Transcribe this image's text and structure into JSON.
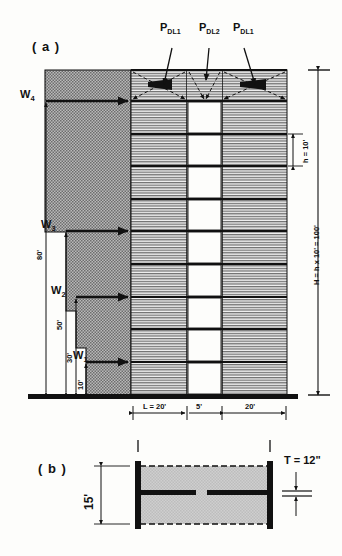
{
  "figure": {
    "panel_a_tag": "( a )",
    "panel_b_tag": "( b )"
  },
  "panel_a": {
    "point_loads": [
      {
        "symbol": "P",
        "sub": "DL",
        "sub2": "1",
        "x": 168,
        "y": 32
      },
      {
        "symbol": "P",
        "sub": "DL",
        "sub2": "2",
        "x": 207,
        "y": 32
      },
      {
        "symbol": "P",
        "sub": "DL",
        "sub2": "1",
        "x": 240,
        "y": 32
      }
    ],
    "wind_loads": [
      {
        "label": "W",
        "sub": "4"
      },
      {
        "label": "W",
        "sub": "3"
      },
      {
        "label": "W",
        "sub": "2"
      },
      {
        "label": "W",
        "sub": "1"
      }
    ],
    "vertical_dims": [
      {
        "text": "80'"
      },
      {
        "text": "50'"
      },
      {
        "text": "30'"
      },
      {
        "text": "10'"
      }
    ],
    "right_dims": {
      "story_height": "h = 10'",
      "total_height": "H = h x 10' = 100'"
    },
    "bottom_dims": [
      {
        "text": "L = 20'"
      },
      {
        "text": "5'"
      },
      {
        "text": "20'"
      }
    ]
  },
  "panel_b": {
    "height_dim": "15'",
    "thickness_dim": "T = 12\""
  },
  "colors": {
    "ink": "#111111",
    "hatch_dark": "#8a8a8a",
    "hatch_light": "#d6d6d6",
    "slab_fill": "#c9c9c9",
    "paper": "#fdfdfb"
  }
}
